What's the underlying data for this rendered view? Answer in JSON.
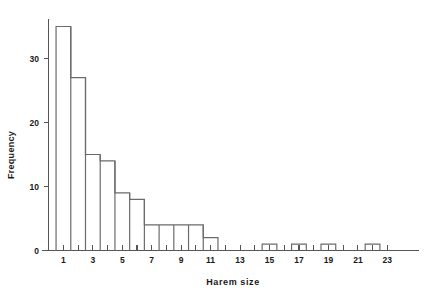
{
  "chart_data": {
    "type": "bar",
    "title": "",
    "subtitle": "",
    "xlabel": "Harem  size",
    "ylabel": "Frequency",
    "categories": [
      1,
      2,
      3,
      4,
      5,
      6,
      7,
      8,
      9,
      10,
      11,
      12,
      13,
      14,
      15,
      16,
      17,
      18,
      19,
      20,
      21,
      22,
      23
    ],
    "values": [
      35,
      27,
      15,
      14,
      9,
      8,
      4,
      4,
      4,
      4,
      2,
      0,
      0,
      0,
      1,
      0,
      1,
      0,
      1,
      0,
      0,
      1,
      0
    ],
    "series": [
      {
        "name": "Harem size frequency",
        "values": [
          35,
          27,
          15,
          14,
          9,
          8,
          4,
          4,
          4,
          4,
          2,
          0,
          0,
          0,
          1,
          0,
          1,
          0,
          1,
          0,
          0,
          1,
          0
        ]
      }
    ],
    "xlim": [
      0.5,
      23.5
    ],
    "ylim": [
      0,
      36
    ],
    "x_ticks": [
      1,
      2,
      3,
      4,
      5,
      6,
      7,
      8,
      9,
      10,
      11,
      12,
      13,
      14,
      15,
      16,
      17,
      18,
      19,
      20,
      21,
      22,
      23
    ],
    "x_tick_labels": [
      "1",
      "",
      "3",
      "",
      "5",
      "",
      "7",
      "",
      "9",
      "",
      "11",
      "",
      "13",
      "",
      "15",
      "",
      "17",
      "",
      "19",
      "",
      "21",
      "",
      "23"
    ],
    "y_ticks": [
      0,
      10,
      20,
      30
    ],
    "y_tick_labels": [
      "0",
      "10",
      "20",
      "30"
    ],
    "grid": false,
    "legend": null,
    "bar_edge_color": "#6b6b6b",
    "bar_fill_color": "none",
    "axis_color": "#555555",
    "background_color": "#ffffff",
    "annotations": []
  },
  "axis": {
    "y_title": "Frequency",
    "x_title": "Harem  size",
    "y_tick_0": "0",
    "y_tick_1": "10",
    "y_tick_2": "20",
    "y_tick_3": "30",
    "x_tick_1": "1",
    "x_tick_3": "3",
    "x_tick_5": "5",
    "x_tick_7": "7",
    "x_tick_9": "9",
    "x_tick_11": "11",
    "x_tick_13": "13",
    "x_tick_15": "15",
    "x_tick_17": "17",
    "x_tick_19": "19",
    "x_tick_21": "21",
    "x_tick_23": "23"
  }
}
